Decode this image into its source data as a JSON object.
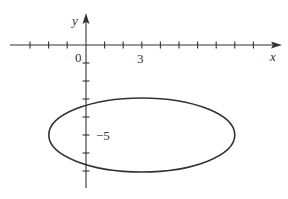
{
  "diagram": {
    "type": "ellipse-on-axes",
    "axes": {
      "x_label": "x",
      "y_label": "y",
      "origin_label": "0",
      "x_tick_label": "3",
      "y_tick_label": "−5"
    },
    "ellipse": {
      "center": [
        3,
        -5
      ],
      "semi_axis_x": 5,
      "semi_axis_y": 2
    },
    "colors": {
      "stroke": "#333333",
      "background": "#ffffff"
    }
  }
}
